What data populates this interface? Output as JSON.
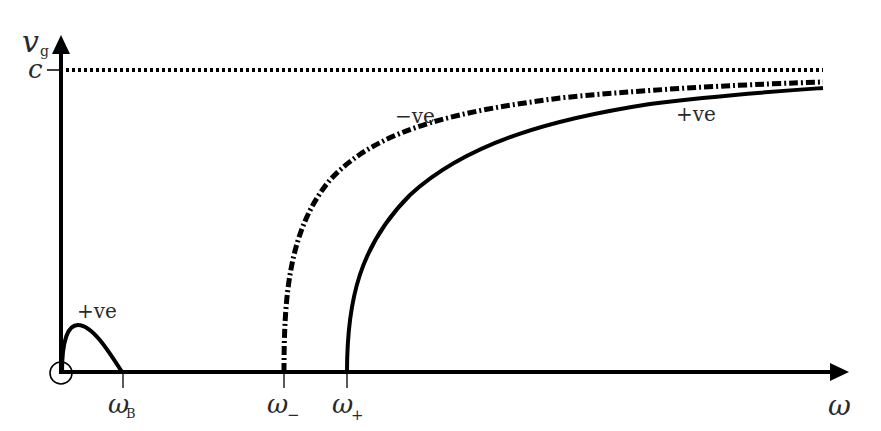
{
  "diagram": {
    "title": "",
    "axes": {
      "x_label": "ω",
      "y_label_main": "v",
      "y_label_sub": "g"
    },
    "y_ticks": [
      {
        "label": "c",
        "meaning": "speed of light asymptote"
      }
    ],
    "x_ticks": [
      {
        "label_main": "ω",
        "label_sub": "B"
      },
      {
        "label_main": "ω",
        "label_sub": "−"
      },
      {
        "label_main": "ω",
        "label_sub": "+"
      }
    ],
    "curve_labels": {
      "whistler": "+ve",
      "minus_branch": "−ve",
      "plus_branch": "+ve"
    },
    "curves": [
      {
        "name": "whistler-mode",
        "style": "solid",
        "polarization": "+ve",
        "from": "0",
        "to": "ω_B"
      },
      {
        "name": "minus-branch",
        "style": "dash-dot",
        "polarization": "−ve",
        "cutoff": "ω_−",
        "asymptote": "c"
      },
      {
        "name": "plus-branch",
        "style": "solid",
        "polarization": "+ve",
        "cutoff": "ω_+",
        "asymptote": "c"
      }
    ],
    "origin_marker": "circle"
  },
  "colors": {
    "ink": "#000000",
    "text": "#2a2a2a",
    "background": "#ffffff"
  }
}
